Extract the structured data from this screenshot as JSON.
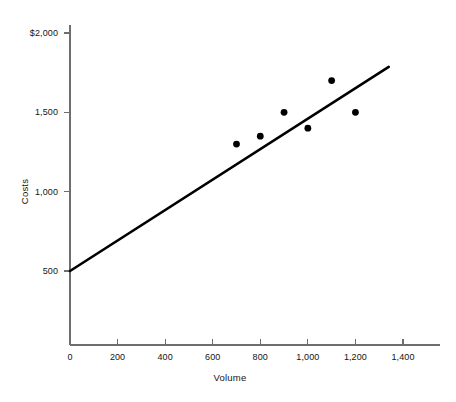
{
  "chart_data": {
    "type": "scatter",
    "title": "",
    "subtitle": "",
    "xlabel": "Volume",
    "ylabel": "Costs",
    "xlim": [
      0,
      1450
    ],
    "ylim": [
      0,
      2120
    ],
    "grid": false,
    "legend": null,
    "x_ticks": [
      {
        "value": 0,
        "label": "0"
      },
      {
        "value": 200,
        "label": "200"
      },
      {
        "value": 400,
        "label": "400"
      },
      {
        "value": 600,
        "label": "600"
      },
      {
        "value": 800,
        "label": "800"
      },
      {
        "value": 1000,
        "label": "1,000"
      },
      {
        "value": 1200,
        "label": "1,200"
      },
      {
        "value": 1400,
        "label": "1,400"
      }
    ],
    "y_ticks": [
      {
        "value": 500,
        "label": "500"
      },
      {
        "value": 1000,
        "label": "1,000"
      },
      {
        "value": 1500,
        "label": "1,500"
      },
      {
        "value": 2000,
        "label": "$2,000"
      }
    ],
    "series": [
      {
        "name": "Observations",
        "type": "scatter",
        "marker": "filled-circle",
        "color": "#000000",
        "points": [
          {
            "x": 700,
            "y": 1300
          },
          {
            "x": 800,
            "y": 1350
          },
          {
            "x": 900,
            "y": 1500
          },
          {
            "x": 1000,
            "y": 1400
          },
          {
            "x": 1100,
            "y": 1700
          },
          {
            "x": 1200,
            "y": 1500
          }
        ]
      },
      {
        "name": "Cost line",
        "type": "line",
        "color": "#000000",
        "intercept": 500,
        "slope": 0.96,
        "points": [
          {
            "x": 0,
            "y": 500
          },
          {
            "x": 1340,
            "y": 1786
          }
        ]
      }
    ]
  },
  "axes": {
    "x_title": "Volume",
    "y_title": "Costs"
  }
}
